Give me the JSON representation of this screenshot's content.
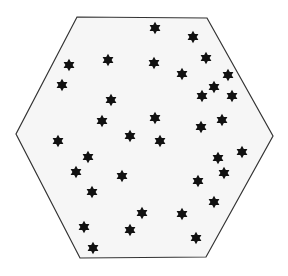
{
  "diagram": {
    "shape": "hexagon",
    "fill": "#f6f6f6",
    "stroke": "#333333",
    "vertices": [
      [
        77,
        17
      ],
      [
        207,
        18
      ],
      [
        273,
        136
      ],
      [
        206,
        257
      ],
      [
        80,
        258
      ],
      [
        16,
        134
      ]
    ],
    "star_color": "#111111",
    "star_radius": 6.2,
    "star_count": 35,
    "stars": [
      [
        155,
        28
      ],
      [
        193,
        37
      ],
      [
        69,
        65
      ],
      [
        108,
        60
      ],
      [
        154,
        63
      ],
      [
        206,
        58
      ],
      [
        182,
        74
      ],
      [
        228,
        75
      ],
      [
        62,
        85
      ],
      [
        214,
        87
      ],
      [
        202,
        96
      ],
      [
        232,
        96
      ],
      [
        111,
        100
      ],
      [
        102,
        121
      ],
      [
        155,
        118
      ],
      [
        222,
        120
      ],
      [
        201,
        127
      ],
      [
        130,
        136
      ],
      [
        160,
        141
      ],
      [
        58,
        141
      ],
      [
        88,
        157
      ],
      [
        218,
        158
      ],
      [
        242,
        152
      ],
      [
        76,
        172
      ],
      [
        224,
        173
      ],
      [
        122,
        176
      ],
      [
        198,
        181
      ],
      [
        92,
        192
      ],
      [
        214,
        202
      ],
      [
        142,
        213
      ],
      [
        182,
        214
      ],
      [
        84,
        227
      ],
      [
        130,
        230
      ],
      [
        196,
        238
      ],
      [
        93,
        248
      ]
    ]
  }
}
